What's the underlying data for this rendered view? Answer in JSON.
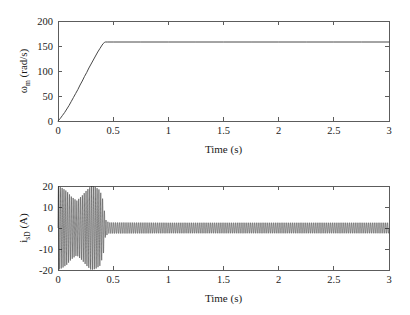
{
  "figure": {
    "background": "#ffffff",
    "line_color": "#333333",
    "axis_color": "#5c5c5c"
  },
  "chart_data": [
    {
      "type": "line",
      "id": "rotor-speed",
      "title": "",
      "xlabel": "Time (s)",
      "ylabel": "ωm (rad/s)",
      "ylabel_base": "ω",
      "ylabel_sub": "m",
      "ylabel_unit": " (rad/s)",
      "xlim": [
        0,
        3
      ],
      "ylim": [
        0,
        200
      ],
      "xticks": [
        0,
        0.5,
        1,
        1.5,
        2,
        2.5,
        3
      ],
      "xtick_labels": [
        "0",
        "0.5",
        "1",
        "1.5",
        "2",
        "2.5",
        "3"
      ],
      "yticks": [
        0,
        50,
        100,
        150,
        200
      ],
      "ytick_labels": [
        "0",
        "50",
        "100",
        "150",
        "200"
      ],
      "grid": false,
      "legend": null,
      "series": [
        {
          "name": "ωm",
          "description": "S-shaped speed ramp from 0 rad/s rising to a steady plateau of about 158 rad/s reached at t = 0.43 s",
          "steady_state_value": 158,
          "settling_time": 0.43,
          "x": [
            0,
            0.02,
            0.04,
            0.06,
            0.08,
            0.1,
            0.12,
            0.14,
            0.16,
            0.18,
            0.2,
            0.22,
            0.24,
            0.26,
            0.28,
            0.3,
            0.32,
            0.34,
            0.36,
            0.38,
            0.4,
            0.41,
            0.42,
            0.43,
            0.45,
            0.5,
            0.75,
            1.0,
            1.25,
            1.5,
            1.75,
            2.0,
            2.25,
            2.5,
            2.75,
            3.0
          ],
          "y": [
            0,
            5,
            11,
            17,
            24,
            31,
            39,
            47,
            55,
            63,
            72,
            80,
            89,
            97,
            106,
            114,
            122,
            130,
            138,
            145,
            152,
            155,
            157,
            158,
            158,
            158,
            158,
            158,
            158,
            158,
            158,
            158,
            158,
            158,
            158,
            158
          ]
        }
      ]
    },
    {
      "type": "line",
      "id": "stator-current-d",
      "title": "",
      "xlabel": "Time (s)",
      "ylabel": "isD (A)",
      "ylabel_base": "i",
      "ylabel_sub": "sD",
      "ylabel_unit": " (A)",
      "xlim": [
        0,
        3
      ],
      "ylim": [
        -20,
        20
      ],
      "xticks": [
        0,
        0.5,
        1,
        1.5,
        2,
        2.5,
        3
      ],
      "xtick_labels": [
        "0",
        "0.5",
        "1",
        "1.5",
        "2",
        "2.5",
        "3"
      ],
      "yticks": [
        -20,
        -10,
        0,
        10,
        20
      ],
      "ytick_labels": [
        "-20",
        "-10",
        "0",
        "10",
        "20"
      ],
      "grid": false,
      "legend": null,
      "series": [
        {
          "name": "isD",
          "description": "High-frequency alternating stator current with a beat envelope during startup: amplitude about 20 A at t=0, waisting to about 13 A near t=0.17 s, swelling back to about 20 A near t=0.30 s, then collapsing at t=0.43 s into a steady dense ripple of about 2.5 A amplitude for the remainder of the run",
          "envelope_points": [
            {
              "t": 0.0,
              "amplitude": 20.0
            },
            {
              "t": 0.04,
              "amplitude": 19.0
            },
            {
              "t": 0.08,
              "amplitude": 17.5
            },
            {
              "t": 0.12,
              "amplitude": 15.0
            },
            {
              "t": 0.17,
              "amplitude": 13.0
            },
            {
              "t": 0.22,
              "amplitude": 15.5
            },
            {
              "t": 0.26,
              "amplitude": 18.0
            },
            {
              "t": 0.3,
              "amplitude": 20.0
            },
            {
              "t": 0.34,
              "amplitude": 19.5
            },
            {
              "t": 0.38,
              "amplitude": 18.0
            },
            {
              "t": 0.41,
              "amplitude": 13.0
            },
            {
              "t": 0.43,
              "amplitude": 4.0
            },
            {
              "t": 0.46,
              "amplitude": 2.6
            },
            {
              "t": 1.0,
              "amplitude": 2.5
            },
            {
              "t": 2.0,
              "amplitude": 2.5
            },
            {
              "t": 3.0,
              "amplitude": 2.5
            }
          ],
          "transient_frequency_hz": 60,
          "steady_frequency_hz": 58,
          "steady_amplitude": 2.5
        }
      ]
    }
  ]
}
